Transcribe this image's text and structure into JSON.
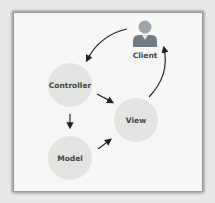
{
  "diagram": {
    "nodes": [
      {
        "id": "client",
        "label": "Client",
        "type": "user-icon"
      },
      {
        "id": "controller",
        "label": "Controller",
        "type": "circle"
      },
      {
        "id": "view",
        "label": "View",
        "type": "circle"
      },
      {
        "id": "model",
        "label": "Model",
        "type": "circle"
      }
    ],
    "edges": [
      {
        "from": "client",
        "to": "controller"
      },
      {
        "from": "controller",
        "to": "view"
      },
      {
        "from": "controller",
        "to": "model"
      },
      {
        "from": "model",
        "to": "view"
      },
      {
        "from": "view",
        "to": "client"
      }
    ],
    "colors": {
      "node_fill": "#e3e3e1",
      "icon_fill": "#6e7b82",
      "arrow": "#222222",
      "frame_bg": "#f7f7f5"
    }
  }
}
